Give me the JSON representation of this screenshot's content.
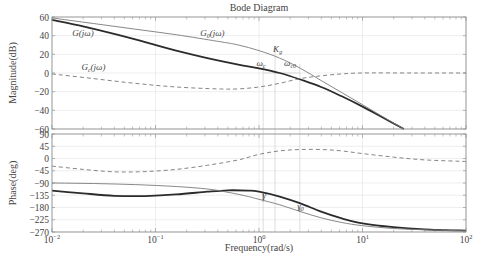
{
  "chart_data": {
    "type": "line",
    "title": "Bode Diagram",
    "xlabel": "Frequency(rad/s)",
    "xscale": "log",
    "xlim": [
      0.01,
      100
    ],
    "x_ticks": [
      {
        "value": -2,
        "label": "10",
        "exp": "-2"
      },
      {
        "value": -1,
        "label": "10",
        "exp": "-1"
      },
      {
        "value": 0,
        "label": "10",
        "exp": "0"
      },
      {
        "value": 1,
        "label": "10",
        "exp": "1"
      },
      {
        "value": 2,
        "label": "10",
        "exp": "2"
      }
    ],
    "subplots": [
      {
        "name": "magnitude",
        "ylabel": "Magnitude(dB)",
        "ylim": [
          -60,
          60
        ],
        "y_ticks": [
          60,
          40,
          20,
          0,
          -20,
          -40,
          -60
        ],
        "grid": true,
        "series": [
          {
            "name": "G(jω)",
            "style": "thick-solid",
            "log_omega": [
              -2,
              -1.7,
              -1.4,
              -1.1,
              -0.8,
              -0.5,
              -0.2,
              0,
              0.2,
              0.4,
              0.6,
              0.8,
              1.0,
              1.2,
              1.4
            ],
            "values": [
              57,
              50,
              42,
              33,
              24,
              16,
              9,
              5,
              0,
              -7,
              -15,
              -25,
              -36,
              -48,
              -60
            ]
          },
          {
            "name": "G0(jω)",
            "style": "thin-solid",
            "log_omega": [
              -2,
              -1.6,
              -1.2,
              -0.8,
              -0.4,
              -0.2,
              0,
              0.2,
              0.4,
              0.6,
              0.8,
              1.0,
              1.2,
              1.4
            ],
            "values": [
              59,
              53,
              47,
              41,
              34,
              30,
              24,
              16,
              5,
              -8,
              -21,
              -34,
              -47,
              -60
            ]
          },
          {
            "name": "Gc(jω)",
            "style": "dashed",
            "log_omega": [
              -2,
              -1.6,
              -1.2,
              -0.8,
              -0.4,
              -0.2,
              0,
              0.2,
              0.4,
              0.6,
              0.8,
              1.0,
              1.5,
              2.0
            ],
            "values": [
              -1,
              -6,
              -11,
              -15,
              -17,
              -17,
              -15,
              -11,
              -6,
              -3,
              -1,
              0,
              0,
              0
            ]
          }
        ]
      },
      {
        "name": "phase",
        "ylabel": "Phase(deg)",
        "ylim": [
          -270,
          90
        ],
        "y_ticks": [
          90,
          45,
          0,
          -45,
          -90,
          -135,
          -180,
          -225,
          -270
        ],
        "grid": true,
        "series": [
          {
            "name": "G(jω)",
            "style": "thick-solid",
            "log_omega": [
              -2,
              -1.7,
              -1.4,
              -1.1,
              -0.8,
              -0.5,
              -0.3,
              -0.1,
              0,
              0.2,
              0.4,
              0.6,
              0.8,
              1.0,
              1.3,
              1.6,
              2.0
            ],
            "values": [
              -118,
              -128,
              -137,
              -138,
              -132,
              -122,
              -117,
              -118,
              -122,
              -140,
              -165,
              -195,
              -220,
              -238,
              -252,
              -260,
              -265
            ]
          },
          {
            "name": "G0(jω)",
            "style": "thin-solid",
            "log_omega": [
              -2,
              -1.6,
              -1.2,
              -0.8,
              -0.5,
              -0.3,
              -0.1,
              0,
              0.2,
              0.4,
              0.6,
              0.8,
              1.0,
              1.3,
              1.6,
              2.0
            ],
            "values": [
              -90,
              -92,
              -96,
              -103,
              -112,
              -124,
              -140,
              -150,
              -170,
              -195,
              -218,
              -235,
              -247,
              -257,
              -262,
              -266
            ]
          },
          {
            "name": "Gc(jω)",
            "style": "dashed",
            "log_omega": [
              -2,
              -1.7,
              -1.4,
              -1.1,
              -0.8,
              -0.5,
              -0.2,
              0,
              0.2,
              0.4,
              0.6,
              0.8,
              1.0,
              1.3,
              1.6,
              2.0
            ],
            "values": [
              -28,
              -40,
              -49,
              -48,
              -40,
              -25,
              -5,
              15,
              28,
              33,
              33,
              28,
              18,
              5,
              -5,
              -11
            ]
          }
        ]
      }
    ],
    "annotations": [
      {
        "subplot": "magnitude",
        "text": "G(jω)",
        "log_omega": -1.7,
        "value": 40
      },
      {
        "subplot": "magnitude",
        "text": "G0(jω)",
        "log_omega": -0.45,
        "value": 40
      },
      {
        "subplot": "magnitude",
        "text": "Gc(jω)",
        "log_omega": -1.6,
        "value": 3
      },
      {
        "subplot": "magnitude",
        "text": "Kg",
        "log_omega": 0.18,
        "value": 22
      },
      {
        "subplot": "magnitude",
        "text": "ωc",
        "log_omega": 0.02,
        "value": 8
      },
      {
        "subplot": "magnitude",
        "text": "ωc0",
        "log_omega": 0.3,
        "value": 8
      },
      {
        "subplot": "phase",
        "text": "γ",
        "log_omega": 0.05,
        "value": -145
      },
      {
        "subplot": "phase",
        "text": "γ0",
        "log_omega": 0.4,
        "value": -185
      }
    ],
    "marker_lines": [
      {
        "name": "omega_c",
        "log_omega": 0.04
      },
      {
        "name": "Kg",
        "log_omega": 0.155
      },
      {
        "name": "omega_c0",
        "log_omega": 0.395
      }
    ]
  }
}
